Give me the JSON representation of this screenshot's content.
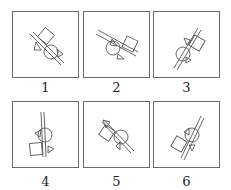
{
  "figure": {
    "panels": [
      {
        "label": "1",
        "rod_angle_deg": 45,
        "square_side": "upper-left"
      },
      {
        "label": "2",
        "rod_angle_deg": 25,
        "square_side": "right"
      },
      {
        "label": "3",
        "rod_angle_deg": -60,
        "square_side": "upper-right"
      },
      {
        "label": "4",
        "rod_angle_deg": 90,
        "square_side": "lower-left"
      },
      {
        "label": "5",
        "rod_angle_deg": 45,
        "square_side": "left"
      },
      {
        "label": "6",
        "rod_angle_deg": -60,
        "square_side": "lower-left"
      }
    ]
  },
  "colors": {
    "stroke": "#555555",
    "border": "#6b6b6b",
    "text": "#222222"
  }
}
